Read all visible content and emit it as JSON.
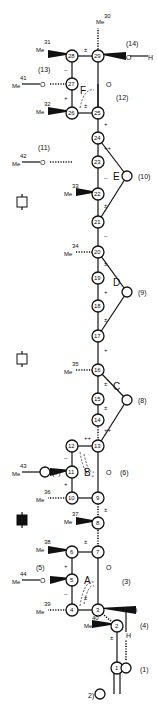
{
  "diagram": {
    "type": "molecular-structure",
    "orientation": "rotated-90",
    "rings": [
      "A",
      "B",
      "C",
      "D",
      "E",
      "F"
    ],
    "atoms": [
      {
        "id": "1",
        "x": 117,
        "y": 668
      },
      {
        "id": "2",
        "x": 117,
        "y": 626
      },
      {
        "id": "3",
        "x": 98,
        "y": 610
      },
      {
        "id": "4",
        "x": 72,
        "y": 610
      },
      {
        "id": "5",
        "x": 72,
        "y": 580
      },
      {
        "id": "6",
        "x": 72,
        "y": 552
      },
      {
        "id": "7",
        "x": 98,
        "y": 552
      },
      {
        "id": "8",
        "x": 98,
        "y": 523
      },
      {
        "id": "9",
        "x": 98,
        "y": 498
      },
      {
        "id": "10",
        "x": 72,
        "y": 498
      },
      {
        "id": "11",
        "x": 72,
        "y": 472
      },
      {
        "id": "12",
        "x": 72,
        "y": 446
      },
      {
        "id": "13",
        "x": 98,
        "y": 446
      },
      {
        "id": "14",
        "x": 98,
        "y": 420
      },
      {
        "id": "15",
        "x": 98,
        "y": 399
      },
      {
        "id": "16",
        "x": 98,
        "y": 370
      },
      {
        "id": "17",
        "x": 98,
        "y": 336
      },
      {
        "id": "18",
        "x": 98,
        "y": 306
      },
      {
        "id": "19",
        "x": 98,
        "y": 278
      },
      {
        "id": "20",
        "x": 98,
        "y": 252
      },
      {
        "id": "21",
        "x": 98,
        "y": 222
      },
      {
        "id": "22",
        "x": 98,
        "y": 194
      },
      {
        "id": "23",
        "x": 98,
        "y": 162
      },
      {
        "id": "24",
        "x": 98,
        "y": 138
      },
      {
        "id": "25",
        "x": 98,
        "y": 113
      },
      {
        "id": "26",
        "x": 72,
        "y": 113
      },
      {
        "id": "27",
        "x": 72,
        "y": 84
      },
      {
        "id": "28",
        "x": 72,
        "y": 56
      },
      {
        "id": "29",
        "x": 98,
        "y": 56
      }
    ],
    "oxygens": [
      {
        "id": "(1)",
        "x": 126,
        "y": 668
      },
      {
        "id": "(2)",
        "x": 100,
        "y": 694
      },
      {
        "id": "(3)",
        "x": 112,
        "y": 580
      },
      {
        "id": "(4)",
        "x": 136,
        "y": 610
      },
      {
        "id": "(5)",
        "x": 45,
        "y": 580
      },
      {
        "id": "(6)",
        "x": 112,
        "y": 472
      },
      {
        "id": "(7)",
        "x": 45,
        "y": 472
      },
      {
        "id": "(8)",
        "x": 127,
        "y": 400
      },
      {
        "id": "(9)",
        "x": 127,
        "y": 292
      },
      {
        "id": "(10)",
        "x": 127,
        "y": 176
      },
      {
        "id": "(11)",
        "x": 45,
        "y": 162
      },
      {
        "id": "(12)",
        "x": 112,
        "y": 84
      },
      {
        "id": "(13)",
        "x": 45,
        "y": 84
      },
      {
        "id": "(14)",
        "x": 126,
        "y": 56
      }
    ],
    "methyls": [
      {
        "id": "30",
        "x": 98,
        "y": 20
      },
      {
        "id": "31",
        "x": 45,
        "y": 46
      },
      {
        "id": "32",
        "x": 45,
        "y": 110
      },
      {
        "id": "33",
        "x": 72,
        "y": 190
      },
      {
        "id": "34",
        "x": 72,
        "y": 250
      },
      {
        "id": "35",
        "x": 72,
        "y": 366
      },
      {
        "id": "36",
        "x": 45,
        "y": 494
      },
      {
        "id": "37",
        "x": 72,
        "y": 520
      },
      {
        "id": "38",
        "x": 45,
        "y": 548
      },
      {
        "id": "39",
        "x": 45,
        "y": 606
      },
      {
        "id": "40",
        "x": 89,
        "y": 622
      },
      {
        "id": "41",
        "x": 18,
        "y": 80
      },
      {
        "id": "42",
        "x": 18,
        "y": 158
      },
      {
        "id": "43",
        "x": 18,
        "y": 468
      },
      {
        "id": "44",
        "x": 18,
        "y": 578
      }
    ],
    "methyl_prefix": "Me",
    "hydrogen_label": "H",
    "charge_label": "2)",
    "markers": [
      {
        "name": "open-box-marker",
        "y": 202
      },
      {
        "name": "open-box-marker",
        "y": 359
      },
      {
        "name": "filled-box-marker",
        "y": 520
      }
    ]
  }
}
